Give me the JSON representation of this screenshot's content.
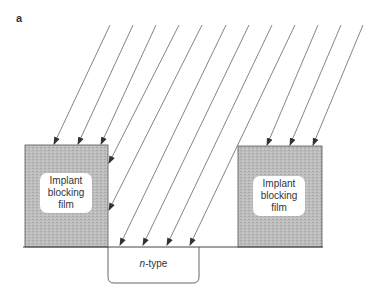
{
  "figure": {
    "panel_label": "a",
    "left_film": {
      "line1": "Implant",
      "line2": "blocking",
      "line3": "film"
    },
    "right_film": {
      "line1": "Implant",
      "line2": "blocking",
      "line3": "film"
    },
    "well": {
      "prefix": "n",
      "suffix": "-type"
    },
    "colors": {
      "film_fill": "#b8b8b8",
      "line": "#555555",
      "background": "#ffffff"
    },
    "beam": {
      "count": 12,
      "description": "Parallel ion implantation beams incident at an angle; blocked by film on both sides, reaching the substrate only in the opening above the n-type region"
    }
  }
}
